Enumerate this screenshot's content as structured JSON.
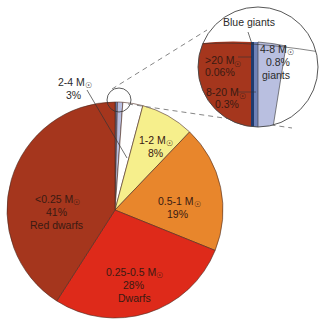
{
  "chart_data": {
    "type": "pie",
    "title": "",
    "start_angle_deg": 0,
    "direction": "clockwise",
    "categories": [
      ">20 M☉",
      "8-20 M☉",
      "4-8 M☉",
      "2-4 M☉",
      "1-2 M☉",
      "0.5-1 M☉",
      "0.25-0.5 M☉",
      "<0.25 M☉"
    ],
    "values": [
      0.06,
      0.3,
      0.8,
      3,
      8,
      19,
      28,
      41
    ],
    "slices": [
      {
        "label": ">20 M☉",
        "percent_text": "0.06%",
        "value": 0.06,
        "group": "Blue giants",
        "color": "#1f3a6e"
      },
      {
        "label": "8-20 M☉",
        "percent_text": "0.3%",
        "value": 0.3,
        "group": "Blue giants",
        "color": "#6f82b8"
      },
      {
        "label": "4-8 M☉",
        "percent_text": "0.8%",
        "value": 0.8,
        "group": "giants",
        "color": "#b9bfe0"
      },
      {
        "label": "2-4 M☉",
        "percent_text": "3%",
        "value": 3,
        "group": "",
        "color": "#ffffff"
      },
      {
        "label": "1-2 M☉",
        "percent_text": "8%",
        "value": 8,
        "group": "",
        "color": "#f6ef8c"
      },
      {
        "label": "0.5-1 M☉",
        "percent_text": "19%",
        "value": 19,
        "group": "",
        "color": "#e8862c"
      },
      {
        "label": "0.25-0.5 M☉",
        "percent_text": "28%",
        "value": 28,
        "group": "Dwarfs",
        "color": "#de2a1a"
      },
      {
        "label": "<0.25 M☉",
        "percent_text": "41%",
        "value": 41,
        "group": "Red dwarfs",
        "color": "#a5361d"
      }
    ],
    "inset": {
      "title": "Blue giants",
      "description": "Magnified view of the smallest slices at the top of the pie",
      "labels": [
        {
          "line1": ">20 M☉",
          "line2": "0.06%"
        },
        {
          "line1": "8-20 M☉",
          "line2": "0.3%"
        },
        {
          "line1": "4-8 M☉",
          "line2": "0.8%",
          "line3": "giants"
        }
      ]
    },
    "legend": "none",
    "xlabel": "",
    "ylabel": ""
  },
  "labels": {
    "inset_title": "Blue giants",
    "gt20_mass": ">20 M",
    "gt20_pct": "0.06%",
    "m8_20_mass": "8-20 M",
    "m8_20_pct": "0.3%",
    "m4_8_mass": "4-8 M",
    "m4_8_pct": "0.8%",
    "m4_8_name": "giants",
    "m2_4_mass": "2-4 M",
    "m2_4_pct": "3%",
    "m1_2_mass": "1-2 M",
    "m1_2_pct": "8%",
    "m05_1_mass": "0.5-1 M",
    "m05_1_pct": "19%",
    "m025_05_mass": "0.25-0.5 M",
    "m025_05_pct": "28%",
    "m025_05_name": "Dwarfs",
    "lt025_mass": "<0.25 M",
    "lt025_pct": "41%",
    "lt025_name": "Red dwarfs",
    "sun_symbol": "☉"
  }
}
